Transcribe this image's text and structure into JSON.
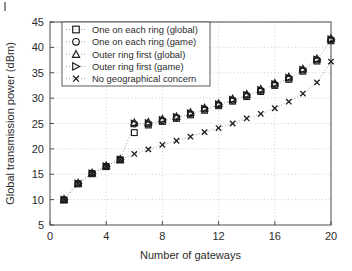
{
  "figure": {
    "background": "#ffffff",
    "ink_color": "#1c1c1c",
    "grid_color": "#b9b9b9"
  },
  "chart_data": {
    "type": "scatter",
    "title": "",
    "xlabel": "Number of gateways",
    "ylabel": "Global transmission power (dBm)",
    "xlim": [
      0,
      20
    ],
    "ylim": [
      5,
      45
    ],
    "xticks": [
      0,
      4,
      8,
      12,
      16,
      20
    ],
    "yticks": [
      5,
      10,
      15,
      20,
      25,
      30,
      35,
      40,
      45
    ],
    "xtick_labels": [
      "0",
      "4",
      "8",
      "12",
      "16",
      "20"
    ],
    "ytick_labels": [
      "5",
      "10",
      "15",
      "20",
      "25",
      "30",
      "35",
      "40",
      "45"
    ],
    "grid": true,
    "grid_style": "dotted",
    "legend_position": "upper left",
    "x": [
      1,
      2,
      3,
      4,
      5,
      6,
      7,
      8,
      9,
      10,
      11,
      12,
      13,
      14,
      15,
      16,
      17,
      18,
      19,
      20
    ],
    "series": [
      {
        "name": "One on each ring (global)",
        "marker": "square",
        "values": [
          9.9,
          13.1,
          15.1,
          16.5,
          17.8,
          23.2,
          24.7,
          25.4,
          26.0,
          26.7,
          27.6,
          28.5,
          29.4,
          30.3,
          31.3,
          32.5,
          33.7,
          35.3,
          37.3,
          41.3
        ]
      },
      {
        "name": "One on each ring (game)",
        "marker": "circle",
        "values": [
          10.0,
          13.2,
          15.2,
          16.6,
          17.9,
          24.9,
          24.9,
          25.6,
          26.2,
          26.9,
          27.8,
          28.7,
          29.6,
          30.5,
          31.5,
          32.7,
          33.9,
          35.5,
          37.5,
          41.5
        ]
      },
      {
        "name": "Outer ring first (global)",
        "marker": "triangle",
        "values": [
          10.1,
          13.3,
          15.3,
          16.7,
          18.0,
          25.2,
          25.3,
          25.9,
          26.4,
          27.2,
          28.1,
          29.0,
          29.9,
          30.8,
          31.8,
          33.0,
          34.2,
          35.8,
          37.8,
          41.8
        ]
      },
      {
        "name": "Outer ring first (game)",
        "marker": "right-triangle",
        "values": [
          10.0,
          13.2,
          15.2,
          16.6,
          17.9,
          25.0,
          25.1,
          25.7,
          26.3,
          27.0,
          27.9,
          28.8,
          29.7,
          30.6,
          31.6,
          32.8,
          34.0,
          35.6,
          37.6,
          41.6
        ]
      },
      {
        "name": "No geographical concern",
        "marker": "x",
        "values": [
          10.0,
          13.2,
          15.2,
          16.6,
          17.9,
          19.0,
          19.9,
          20.8,
          21.6,
          22.4,
          23.3,
          24.1,
          25.0,
          26.0,
          26.9,
          28.0,
          29.3,
          30.9,
          33.1,
          37.2
        ]
      }
    ]
  },
  "legend": {
    "entries": [
      {
        "label": "One on each ring (global)",
        "marker": "square"
      },
      {
        "label": "One on each ring (game)",
        "marker": "circle"
      },
      {
        "label": "Outer ring first (global)",
        "marker": "triangle"
      },
      {
        "label": "Outer ring first (game)",
        "marker": "right-triangle"
      },
      {
        "label": "No geographical concern",
        "marker": "x"
      }
    ]
  }
}
